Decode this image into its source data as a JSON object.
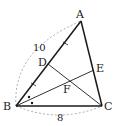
{
  "diagram": {
    "type": "triangle-geometry",
    "points": {
      "A": {
        "label": "A",
        "x": 81,
        "y": 21
      },
      "B": {
        "label": "B",
        "x": 16,
        "y": 106
      },
      "C": {
        "label": "C",
        "x": 102,
        "y": 106
      },
      "D": {
        "label": "D",
        "x": 48,
        "y": 64
      },
      "E": {
        "label": "E",
        "x": 94,
        "y": 70
      },
      "F": {
        "label": "F",
        "x": 69,
        "y": 80
      }
    },
    "segments": [
      {
        "from": "A",
        "to": "B",
        "weight": "bold"
      },
      {
        "from": "A",
        "to": "C",
        "weight": "bold"
      },
      {
        "from": "B",
        "to": "C",
        "weight": "bold"
      },
      {
        "from": "D",
        "to": "C",
        "weight": "thin"
      },
      {
        "from": "B",
        "to": "E",
        "weight": "thin"
      }
    ],
    "measurements": {
      "AB": "10",
      "BC": "8"
    },
    "marks": {
      "equal_ticks": "AD = DB",
      "angle_bisector_dots": "angle ABE = angle EBC"
    },
    "colors": {
      "line": "#1a1a1a",
      "dashed_arc": "#888888"
    }
  }
}
